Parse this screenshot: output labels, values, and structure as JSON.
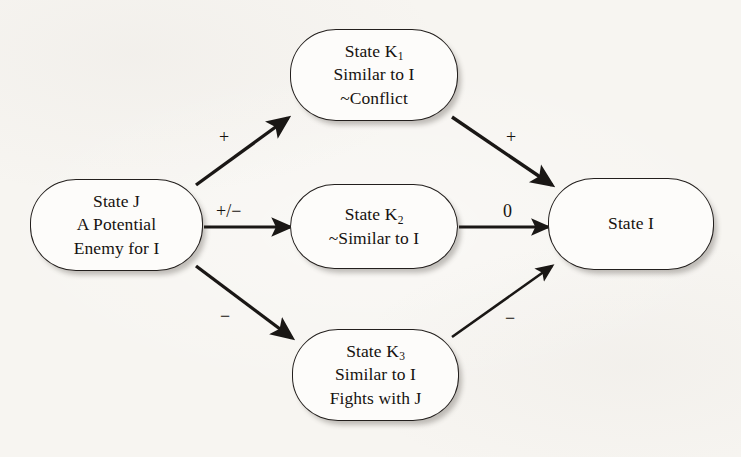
{
  "diagram": {
    "type": "flow-diagram",
    "background_color": "#f7f5f1",
    "stroke_color": "#231f1d",
    "node_fill": "#fdfcfa",
    "nodes": [
      {
        "id": "state-j",
        "lines": [
          "State J",
          "A Potential",
          "Enemy for I"
        ],
        "x": 30,
        "y": 179,
        "w": 173,
        "h": 92
      },
      {
        "id": "state-k1",
        "lines": [
          "State K",
          "Similar to I",
          "~Conflict"
        ],
        "subscript": "1",
        "x": 290,
        "y": 29,
        "w": 168,
        "h": 92
      },
      {
        "id": "state-k2",
        "lines": [
          "State K",
          "~Similar to I"
        ],
        "subscript": "2",
        "x": 290,
        "y": 184,
        "w": 168,
        "h": 85
      },
      {
        "id": "state-k3",
        "lines": [
          "State K",
          "Similar to I",
          "Fights with J"
        ],
        "subscript": "3",
        "x": 292,
        "y": 329,
        "w": 167,
        "h": 92
      },
      {
        "id": "state-i",
        "lines": [
          "State I"
        ],
        "x": 548,
        "y": 178,
        "w": 166,
        "h": 92
      }
    ],
    "edges": [
      {
        "id": "j-to-k1",
        "from": "state-j",
        "to": "state-k1",
        "label": "+",
        "label_x": 219,
        "label_y": 128
      },
      {
        "id": "j-to-k2",
        "from": "state-j",
        "to": "state-k2",
        "label": "+/−",
        "label_x": 216,
        "label_y": 202
      },
      {
        "id": "j-to-k3",
        "from": "state-j",
        "to": "state-k3",
        "label": "−",
        "label_x": 220,
        "label_y": 307
      },
      {
        "id": "k1-to-i",
        "from": "state-k1",
        "to": "state-i",
        "label": "+",
        "label_x": 506,
        "label_y": 128
      },
      {
        "id": "k2-to-i",
        "from": "state-k2",
        "to": "state-i",
        "label": "0",
        "label_x": 503,
        "label_y": 202
      },
      {
        "id": "k3-to-i",
        "from": "state-k3",
        "to": "state-i",
        "label": "−",
        "label_x": 505,
        "label_y": 309
      }
    ]
  }
}
